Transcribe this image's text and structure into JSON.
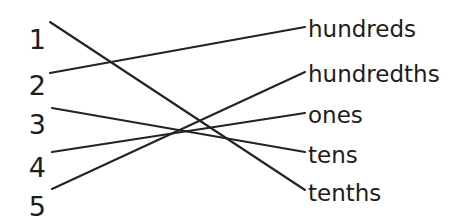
{
  "worksheet": {
    "type": "matching-exercise",
    "width": 467,
    "height": 217,
    "background_color": "#ffffff",
    "line_color": "#232323",
    "text_color": "#1d1d1d",
    "left_column": [
      {
        "label": "1",
        "x": 40,
        "y": 26,
        "anchor_x": 50,
        "anchor_y": 22
      },
      {
        "label": "2",
        "x": 40,
        "y": 72,
        "anchor_x": 50,
        "anchor_y": 73
      },
      {
        "label": "3",
        "x": 40,
        "y": 111,
        "anchor_x": 52,
        "anchor_y": 108
      },
      {
        "label": "4",
        "x": 40,
        "y": 154,
        "anchor_x": 52,
        "anchor_y": 152
      },
      {
        "label": "5",
        "x": 40,
        "y": 193,
        "anchor_x": 52,
        "anchor_y": 189
      }
    ],
    "right_column": [
      {
        "label": "hundreds",
        "x": 0,
        "y": 18,
        "anchor_x": 305,
        "anchor_y": 27
      },
      {
        "label": "hundredths",
        "x": 0,
        "y": 63,
        "anchor_x": 305,
        "anchor_y": 72
      },
      {
        "label": "ones",
        "x": 0,
        "y": 104,
        "anchor_x": 305,
        "anchor_y": 113
      },
      {
        "label": "tens",
        "x": 0,
        "y": 144,
        "anchor_x": 305,
        "anchor_y": 152
      },
      {
        "label": "tenths",
        "x": 0,
        "y": 182,
        "anchor_x": 305,
        "anchor_y": 190
      }
    ],
    "connections": [
      {
        "from": "1",
        "to": "tenths",
        "x1": 50,
        "y1": 22,
        "x2": 305,
        "y2": 190
      },
      {
        "from": "2",
        "to": "hundreds",
        "x1": 50,
        "y1": 73,
        "x2": 305,
        "y2": 27
      },
      {
        "from": "3",
        "to": "tens",
        "x1": 52,
        "y1": 108,
        "x2": 305,
        "y2": 152
      },
      {
        "from": "4",
        "to": "ones",
        "x1": 52,
        "y1": 152,
        "x2": 305,
        "y2": 113
      },
      {
        "from": "5",
        "to": "hundredths",
        "x1": 52,
        "y1": 189,
        "x2": 305,
        "y2": 72
      }
    ]
  }
}
